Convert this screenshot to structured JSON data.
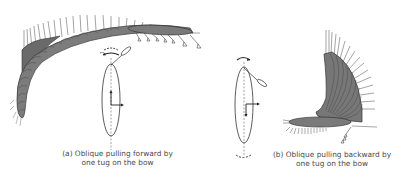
{
  "figure": {
    "panels": [
      {
        "id": "a",
        "caption_line1": "(a) Oblique pulling forward by",
        "caption_line2": "one tug on the bow",
        "trajectory_shape": "ship tracks sweeping forward along a long curved arc (upper-left)",
        "tug_position": "bow, pulling forward-oblique"
      },
      {
        "id": "b",
        "caption_line1": "(b) Oblique pulling backward by",
        "caption_line2": "one tug on the bow",
        "trajectory_shape": "ship tracks fanning upward from a horizontal start (right)",
        "tug_position": "bow, pulling backward-oblique"
      }
    ],
    "colors": {
      "hull_fill": "#7a7a7a",
      "hull_stroke": "#3c3c3c",
      "track_line": "#5a5a5a",
      "outline": "#333333",
      "caption_text": "#4a4a4a"
    }
  }
}
